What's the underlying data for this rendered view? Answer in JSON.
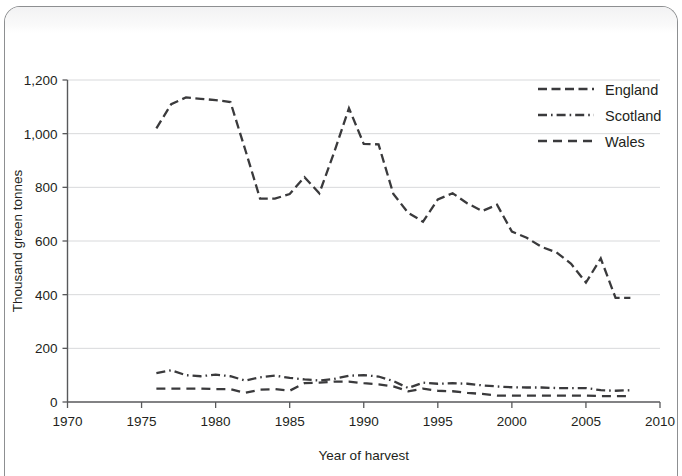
{
  "chart_data": {
    "type": "line",
    "title": "",
    "xlabel": "Year of harvest",
    "ylabel": "Thousand green tonnes",
    "xlim": [
      1970,
      2010
    ],
    "ylim": [
      0,
      1200
    ],
    "xticks": [
      "1970",
      "1975",
      "1980",
      "1985",
      "1990",
      "1995",
      "2000",
      "2005",
      "2010"
    ],
    "yticks": [
      "0",
      "200",
      "400",
      "600",
      "800",
      "1,000",
      "1,200"
    ],
    "grid": "horizontal",
    "legend_position": "top-right",
    "series": [
      {
        "name": "England",
        "dash": "long-dash",
        "x": [
          1976,
          1977,
          1978,
          1979,
          1980,
          1981,
          1982,
          1983,
          1984,
          1985,
          1986,
          1987,
          1988,
          1989,
          1990,
          1991,
          1992,
          1993,
          1994,
          1995,
          1996,
          1997,
          1998,
          1999,
          2000,
          2001,
          2002,
          2003,
          2004,
          2005,
          2006,
          2007,
          2008
        ],
        "values": [
          1020,
          1110,
          1135,
          1130,
          1125,
          1118,
          940,
          758,
          758,
          775,
          838,
          778,
          930,
          1095,
          962,
          960,
          775,
          705,
          672,
          755,
          778,
          740,
          712,
          735,
          635,
          612,
          578,
          558,
          515,
          445,
          535,
          388,
          388
        ]
      },
      {
        "name": "Scotland",
        "dash": "dash-dot",
        "x": [
          1976,
          1977,
          1978,
          1979,
          1980,
          1981,
          1982,
          1983,
          1984,
          1985,
          1986,
          1987,
          1988,
          1989,
          1990,
          1991,
          1992,
          1993,
          1994,
          1995,
          1996,
          1997,
          1998,
          1999,
          2000,
          2001,
          2002,
          2003,
          2004,
          2005,
          2006,
          2007,
          2008
        ],
        "values": [
          108,
          118,
          100,
          96,
          102,
          96,
          80,
          92,
          98,
          90,
          84,
          80,
          86,
          98,
          100,
          95,
          78,
          52,
          72,
          68,
          70,
          68,
          62,
          58,
          55,
          54,
          54,
          52,
          52,
          52,
          44,
          42,
          44
        ]
      },
      {
        "name": "Wales",
        "dash": "dash",
        "x": [
          1976,
          1977,
          1978,
          1979,
          1980,
          1981,
          1982,
          1983,
          1984,
          1985,
          1986,
          1987,
          1988,
          1989,
          1990,
          1991,
          1992,
          1993,
          1994,
          1995,
          1996,
          1997,
          1998,
          1999,
          2000,
          2001,
          2002,
          2003,
          2004,
          2005,
          2006,
          2007,
          2008
        ],
        "values": [
          50,
          50,
          50,
          50,
          48,
          48,
          34,
          46,
          48,
          42,
          70,
          72,
          76,
          76,
          70,
          66,
          58,
          40,
          50,
          42,
          40,
          34,
          30,
          24,
          24,
          24,
          24,
          24,
          24,
          24,
          22,
          22,
          22
        ]
      }
    ]
  },
  "legend": {
    "items": [
      {
        "label": "England"
      },
      {
        "label": "Scotland"
      },
      {
        "label": "Wales"
      }
    ]
  },
  "colors": {
    "line": "#3a3a3c",
    "grid": "#d8d9db",
    "axis": "#58595b",
    "text": "#231f20",
    "page_border": "#8d8f91"
  }
}
